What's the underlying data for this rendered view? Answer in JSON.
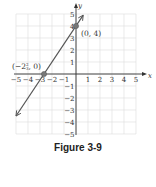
{
  "figure": {
    "caption": "Figure 3-9"
  },
  "chart_data": {
    "type": "line",
    "title": "",
    "xlabel": "x",
    "ylabel": "y",
    "xlim": [
      -5,
      5
    ],
    "ylim": [
      -5,
      5
    ],
    "grid": true,
    "x_ticks": [
      -5,
      -4,
      -3,
      -2,
      -1,
      1,
      2,
      3,
      4,
      5
    ],
    "y_ticks": [
      -5,
      -4,
      -3,
      -2,
      -1,
      1,
      2,
      3,
      4,
      5
    ],
    "series": [
      {
        "name": "y = 1.5x + 4",
        "equation": "y = (3/2)x + 4",
        "slope": 1.5,
        "intercept": 4,
        "x": [
          -5,
          0.6
        ],
        "y": [
          -3.5,
          4.9
        ],
        "color": "#555555"
      }
    ],
    "points": [
      {
        "x": -2.6667,
        "y": 0,
        "label": "(−2⅔, 0)"
      },
      {
        "x": 0,
        "y": 4,
        "label": "(0, 4)"
      }
    ],
    "annotations": [
      "(−2⅔, 0)",
      "(0, 4)"
    ]
  },
  "labels": {
    "x_axis": "x",
    "y_axis": "y",
    "point_a": "(0, 4)",
    "point_b_prefix": "(−2",
    "point_b_num": "2",
    "point_b_den": "3",
    "point_b_suffix": ", 0)"
  }
}
